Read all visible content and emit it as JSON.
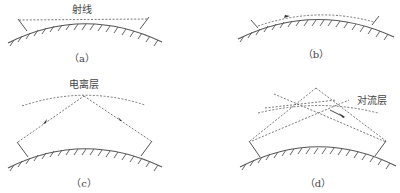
{
  "figure": {
    "panels": [
      {
        "id": "a",
        "caption": "（a）",
        "label": "射线",
        "mode": "line-of-sight"
      },
      {
        "id": "b",
        "caption": "（b）",
        "label": "",
        "mode": "ground-wave"
      },
      {
        "id": "c",
        "caption": "（c）",
        "label": "电离层",
        "mode": "ionospheric-reflection"
      },
      {
        "id": "d",
        "caption": "（d）",
        "label": "对流层",
        "mode": "tropospheric-scatter"
      }
    ]
  },
  "colors": {
    "line": "#555555",
    "text": "#444444",
    "background": "#ffffff"
  }
}
